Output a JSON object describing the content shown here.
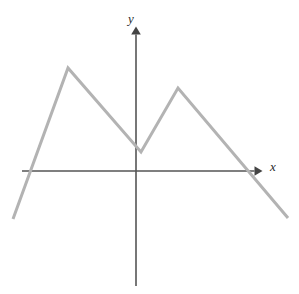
{
  "figure": {
    "background_color": "#ffffff",
    "width": 299,
    "height": 294
  },
  "axes": {
    "x_axis": {
      "label": "x",
      "label_icon": "x-axis-label",
      "color": "#555555",
      "stroke_width": 1.6,
      "origin_px": {
        "x": 136,
        "y": 171
      },
      "start_px": {
        "x": 22,
        "y": 171
      },
      "end_px": {
        "x": 261,
        "y": 171
      },
      "arrow": "right",
      "arrow_tip_px": {
        "x": 261,
        "y": 171
      }
    },
    "y_axis": {
      "label": "y",
      "label_icon": "y-axis-label",
      "color": "#555555",
      "stroke_width": 1.6,
      "origin_px": {
        "x": 136,
        "y": 171
      },
      "start_px": {
        "x": 136,
        "y": 286
      },
      "end_px": {
        "x": 136,
        "y": 28
      },
      "arrow": "up",
      "arrow_tip_px": {
        "x": 136,
        "y": 28
      }
    }
  },
  "chart_data": {
    "type": "line",
    "title": "",
    "subtitle": "",
    "xlabel": "x",
    "ylabel": "y",
    "grid": false,
    "legend": null,
    "series": [
      {
        "name": "piecewise-linear-curve",
        "color": "#b3b3b3",
        "stroke_width": 3,
        "style": "solid",
        "comment": "Vertices in pixel coordinates, origin at (136,171); y increases upward in data space",
        "points_px": [
          {
            "x": 13,
            "y": 219
          },
          {
            "x": 68,
            "y": 68
          },
          {
            "x": 141,
            "y": 152
          },
          {
            "x": 178,
            "y": 88
          },
          {
            "x": 288,
            "y": 218
          }
        ],
        "points_data": [
          {
            "x": -5.13,
            "y": -2.18
          },
          {
            "x": -3.09,
            "y": 4.68
          },
          {
            "x": 0.23,
            "y": 0.86
          },
          {
            "x": 1.91,
            "y": 3.77
          },
          {
            "x": 6.91,
            "y": -2.14
          }
        ],
        "x_intercepts_px": [
          {
            "x": 30,
            "y": 171
          },
          {
            "x": 247,
            "y": 171
          }
        ],
        "y_intercept_px": {
          "x": 136,
          "y": 146
        },
        "local_maxima_px": [
          {
            "x": 68,
            "y": 68
          },
          {
            "x": 178,
            "y": 88
          }
        ],
        "local_minima_px": [
          {
            "x": 141,
            "y": 152
          }
        ]
      }
    ],
    "xlim": [
      -5.13,
      6.91
    ],
    "ylim": [
      -2.18,
      4.68
    ]
  },
  "colors": {
    "curve": "#b3b3b3",
    "axis": "#555555",
    "label": "#2b2b2b",
    "background": "#ffffff"
  }
}
